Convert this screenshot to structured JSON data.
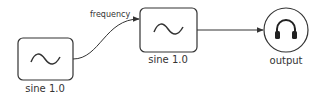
{
  "nodes": [
    {
      "id": "sine1",
      "type": "oscillator",
      "icon": "sine-wave-icon",
      "label": "sine 1.0"
    },
    {
      "id": "sine2",
      "type": "oscillator",
      "icon": "sine-wave-icon",
      "label": "sine 1.0"
    },
    {
      "id": "output",
      "type": "output",
      "icon": "headphones-icon",
      "label": "output"
    }
  ],
  "edges": [
    {
      "from": "sine1",
      "to": "sine2",
      "label": "frequency"
    },
    {
      "from": "sine2",
      "to": "output",
      "label": ""
    }
  ],
  "colors": {
    "stroke": "#333333",
    "background": "#ffffff"
  }
}
